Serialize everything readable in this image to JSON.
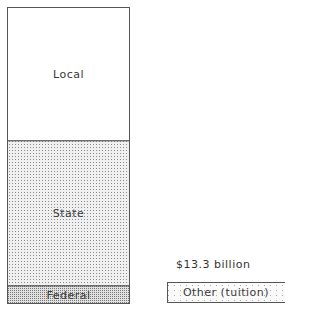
{
  "chart_data": {
    "type": "bar",
    "title": "",
    "stacked": true,
    "categories": [
      "Public school revenue"
    ],
    "series": [
      {
        "name": "Federal",
        "share_percent": 6,
        "pattern": "dense-dots"
      },
      {
        "name": "State",
        "share_percent": 49,
        "pattern": "dots"
      },
      {
        "name": "Local",
        "share_percent": 45,
        "pattern": "none"
      }
    ],
    "other": {
      "name": "Other (tuition)",
      "value_label": "$13.3 billion",
      "pattern": "sparse-dots"
    },
    "colors": {
      "border": "#555555",
      "local_fill": "#ffffff",
      "state_fill": "#d9d9d9",
      "federal_fill": "#c4c4c4",
      "other_fill": "#f2f2f2"
    }
  }
}
